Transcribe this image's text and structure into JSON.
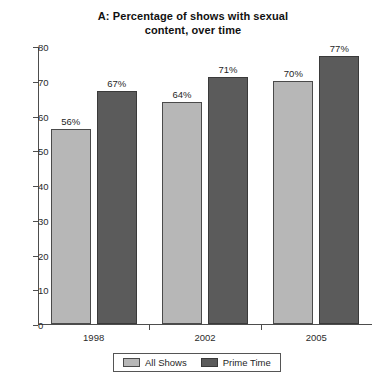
{
  "chart_data": {
    "type": "bar",
    "title": "A: Percentage of shows with sexual content, over time",
    "title_lines": [
      "A: Percentage of shows with sexual",
      "content, over time"
    ],
    "categories": [
      "1998",
      "2002",
      "2005"
    ],
    "series": [
      {
        "name": "All Shows",
        "color": "#b7b7b7",
        "values": [
          56,
          64,
          70
        ],
        "labels": [
          "56%",
          "64%",
          "70%"
        ]
      },
      {
        "name": "Prime Time",
        "color": "#5b5b5b",
        "values": [
          67,
          71,
          77
        ],
        "labels": [
          "67%",
          "71%",
          "77%"
        ]
      }
    ],
    "xlabel": "",
    "ylabel": "",
    "ylim": [
      0,
      80
    ],
    "yticks": [
      0,
      10,
      20,
      30,
      40,
      50,
      60,
      70,
      80
    ],
    "ytick_labels": [
      "0",
      "10",
      "20",
      "30",
      "40",
      "50",
      "60",
      "70",
      "80"
    ],
    "grid": false,
    "legend_position": "bottom",
    "value_labels": true
  }
}
